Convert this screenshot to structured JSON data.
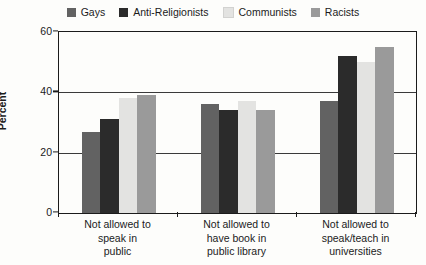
{
  "chart_data": {
    "type": "bar",
    "title": "",
    "xlabel": "",
    "ylabel": "Percent",
    "ylim": [
      0,
      60
    ],
    "yticks": [
      0,
      20,
      40,
      60
    ],
    "grid": true,
    "legend_position": "top-center",
    "categories": [
      "Not allowed to speak in public",
      "Not allowed to have book in public library",
      "Not allowed to speak/teach in universities"
    ],
    "category_lines": [
      [
        "Not allowed to",
        "speak in",
        "public"
      ],
      [
        "Not allowed to",
        "have book in",
        "public library"
      ],
      [
        "Not allowed to",
        "speak/teach in",
        "universities"
      ]
    ],
    "series": [
      {
        "name": "Gays",
        "color": "#626262",
        "values": [
          27,
          36,
          37
        ]
      },
      {
        "name": "Anti-Religionists",
        "color": "#2b2b2b",
        "values": [
          31,
          34,
          52
        ]
      },
      {
        "name": "Communists",
        "color": "#e3e3e1",
        "values": [
          38,
          37,
          50
        ]
      },
      {
        "name": "Racists",
        "color": "#9a9a9a",
        "values": [
          39,
          34,
          55
        ]
      }
    ]
  }
}
